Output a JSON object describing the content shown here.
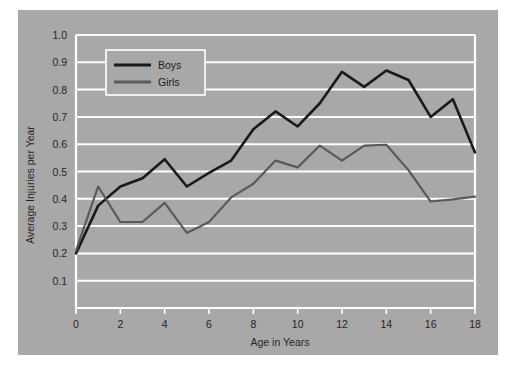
{
  "chart_data": {
    "type": "line",
    "title": "",
    "subtitle": "",
    "xlabel": "Age in Years",
    "ylabel": "Average Injuries per Year",
    "xlim": [
      0,
      18
    ],
    "ylim": [
      0,
      1.0
    ],
    "xticks": [
      "0",
      "2",
      "4",
      "6",
      "8",
      "10",
      "12",
      "14",
      "16",
      "18"
    ],
    "xtick_values": [
      0,
      2,
      4,
      6,
      8,
      10,
      12,
      14,
      16,
      18
    ],
    "yticks": [
      "0.1",
      "0.2",
      "0.3",
      "0.4",
      "0.5",
      "0.6",
      "0.7",
      "0.8",
      "0.9",
      "1.0"
    ],
    "ytick_values": [
      0.1,
      0.2,
      0.3,
      0.4,
      0.5,
      0.6,
      0.7,
      0.8,
      0.9,
      1.0
    ],
    "grid": true,
    "grid_orientation": "horizontal",
    "grid_color": "#ffffff",
    "legend_position": "top-left-inside",
    "plot_background": "#a8a8a8",
    "x": [
      0,
      1,
      2,
      3,
      4,
      5,
      6,
      7,
      8,
      9,
      10,
      11,
      12,
      13,
      14,
      15,
      16,
      17,
      18
    ],
    "series": [
      {
        "name": "Boys",
        "color": "#1a1a1a",
        "linewidth": 2.6,
        "values": [
          0.2,
          0.375,
          0.445,
          0.475,
          0.545,
          0.445,
          0.495,
          0.54,
          0.655,
          0.72,
          0.665,
          0.75,
          0.865,
          0.81,
          0.87,
          0.835,
          0.7,
          0.765,
          0.57
        ]
      },
      {
        "name": "Girls",
        "color": "#5a5a5a",
        "linewidth": 2.2,
        "values": [
          0.21,
          0.445,
          0.315,
          0.315,
          0.385,
          0.275,
          0.315,
          0.405,
          0.455,
          0.54,
          0.515,
          0.595,
          0.54,
          0.595,
          0.598,
          0.505,
          0.39,
          0.398,
          0.408
        ]
      }
    ]
  },
  "legend": {
    "entries": [
      {
        "label": "Boys"
      },
      {
        "label": "Girls"
      }
    ]
  }
}
